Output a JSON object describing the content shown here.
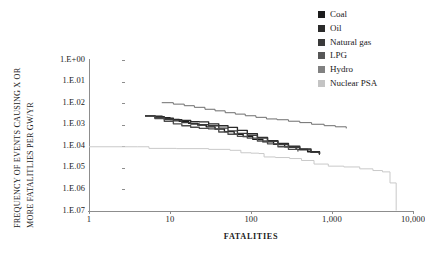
{
  "chart_data": {
    "type": "line",
    "title": "",
    "xlabel": "FATALITIES",
    "ylabel_line1": "FREQUENCY OF EVENTS CAUSING X OR",
    "ylabel_line2": "MORE FATALITLIES PER GW/YR",
    "x_scale": "log",
    "y_scale": "log",
    "xlim": [
      1,
      10000
    ],
    "ylim": [
      1e-07,
      1
    ],
    "x_ticks": [
      1,
      10,
      100,
      1000,
      10000
    ],
    "x_tick_labels": [
      "1",
      "10",
      "100",
      "1,000",
      "10,000"
    ],
    "y_ticks": [
      1,
      0.1,
      0.01,
      0.001,
      0.0001,
      1e-05,
      1e-06,
      1e-07
    ],
    "y_tick_labels": [
      "1.E+00",
      "1.E.01",
      "1.E.02",
      "1.E.03",
      "1.E.04",
      "1.E.05",
      "1.E.06",
      "1.E.07"
    ],
    "grid": false,
    "legend_position": "top-right",
    "series": [
      {
        "name": "Coal",
        "color": "#1c1c1c",
        "points": [
          [
            5.0,
            0.0026
          ],
          [
            6.2,
            0.0025
          ],
          [
            8.0,
            0.0021
          ],
          [
            10.0,
            0.00175
          ],
          [
            13.0,
            0.00145
          ],
          [
            17.0,
            0.00115
          ],
          [
            22.0,
            0.00095
          ],
          [
            28.0,
            0.0008
          ],
          [
            36.0,
            0.00062
          ],
          [
            47.0,
            0.00048
          ],
          [
            62.0,
            0.00036
          ],
          [
            80.0,
            0.00028
          ],
          [
            105.0,
            0.00021
          ],
          [
            140.0,
            0.00016
          ],
          [
            190.0,
            0.000125
          ],
          [
            260.0,
            9.5e-05
          ],
          [
            360.0,
            7.2e-05
          ],
          [
            500.0,
            5.6e-05
          ],
          [
            700.0,
            4.4e-05
          ]
        ]
      },
      {
        "name": "Oil",
        "color": "#2b2b2b",
        "points": [
          [
            5.0,
            0.0026
          ],
          [
            6.5,
            0.00235
          ],
          [
            8.5,
            0.002
          ],
          [
            11.0,
            0.0017
          ],
          [
            14.0,
            0.0016
          ],
          [
            18.0,
            0.0014
          ],
          [
            23.0,
            0.00135
          ],
          [
            30.0,
            0.0011
          ],
          [
            40.0,
            0.0009
          ],
          [
            52.0,
            0.00075
          ],
          [
            68.0,
            0.00055
          ],
          [
            90.0,
            0.00038
          ],
          [
            120.0,
            0.00026
          ],
          [
            160.0,
            0.00018
          ],
          [
            215.0,
            0.000135
          ],
          [
            290.0,
            0.0001
          ],
          [
            400.0,
            7.5e-05
          ],
          [
            550.0,
            5.6e-05
          ],
          [
            700.0,
            4.6e-05
          ]
        ]
      },
      {
        "name": "Natural gas",
        "color": "#3a3a3a",
        "points": [
          [
            5.0,
            0.00255
          ],
          [
            6.5,
            0.0022
          ],
          [
            8.5,
            0.0018
          ],
          [
            11.0,
            0.0015
          ],
          [
            14.0,
            0.00125
          ],
          [
            18.0,
            0.00108
          ],
          [
            23.0,
            0.001
          ],
          [
            30.0,
            0.0009
          ],
          [
            40.0,
            0.0007
          ],
          [
            52.0,
            0.00052
          ],
          [
            68.0,
            0.0004
          ],
          [
            90.0,
            0.00032
          ],
          [
            120.0,
            0.00024
          ],
          [
            160.0,
            0.00017
          ],
          [
            215.0,
            0.00012
          ],
          [
            290.0,
            9e-05
          ],
          [
            400.0,
            6.8e-05
          ],
          [
            550.0,
            5.2e-05
          ],
          [
            700.0,
            4.4e-05
          ]
        ]
      },
      {
        "name": "LPG",
        "color": "#4c4c4c",
        "points": [
          [
            5.0,
            0.0025
          ],
          [
            6.5,
            0.00195
          ],
          [
            8.5,
            0.00145
          ],
          [
            11.0,
            0.0011
          ],
          [
            14.0,
            0.0009
          ],
          [
            18.0,
            0.00076
          ],
          [
            23.0,
            0.00068
          ],
          [
            30.0,
            0.00064
          ],
          [
            40.0,
            0.00046
          ],
          [
            52.0,
            0.00036
          ],
          [
            68.0,
            0.00029
          ],
          [
            90.0,
            0.00024
          ],
          [
            120.0,
            0.000175
          ],
          [
            160.0,
            0.00013
          ],
          [
            215.0,
            9.5e-05
          ],
          [
            290.0,
            7.2e-05
          ],
          [
            380.0,
            6e-05
          ]
        ]
      },
      {
        "name": "Hydro",
        "color": "#6e6e6e",
        "points": [
          [
            8.0,
            0.0105
          ],
          [
            11.0,
            0.009
          ],
          [
            15.0,
            0.0076
          ],
          [
            20.0,
            0.0064
          ],
          [
            27.0,
            0.0052
          ],
          [
            36.0,
            0.0044
          ],
          [
            48.0,
            0.0036
          ],
          [
            64.0,
            0.0031
          ],
          [
            85.0,
            0.0026
          ],
          [
            115.0,
            0.0022
          ],
          [
            155.0,
            0.00185
          ],
          [
            210.0,
            0.0017
          ],
          [
            290.0,
            0.00145
          ],
          [
            400.0,
            0.00125
          ],
          [
            560.0,
            0.00105
          ],
          [
            800.0,
            0.0009
          ],
          [
            1100.0,
            0.0008
          ],
          [
            1500.0,
            0.0007
          ]
        ]
      },
      {
        "name": "Nuclear PSA",
        "color": "#c9c9c9",
        "points": [
          [
            1.0,
            9.5e-05
          ],
          [
            4.0,
            9.5e-05
          ],
          [
            5.5,
            8e-05
          ],
          [
            12.0,
            7.8e-05
          ],
          [
            30.0,
            7.2e-05
          ],
          [
            55.0,
            6.5e-05
          ],
          [
            75.0,
            5e-05
          ],
          [
            100.0,
            4.8e-05
          ],
          [
            125.0,
            4.6e-05
          ],
          [
            145.0,
            3.2e-05
          ],
          [
            200.0,
            3e-05
          ],
          [
            300.0,
            2.7e-05
          ],
          [
            420.0,
            2.2e-05
          ],
          [
            600.0,
            1.5e-05
          ],
          [
            900.0,
            1.2e-05
          ],
          [
            1400.0,
            1.1e-05
          ],
          [
            2200.0,
            9e-06
          ],
          [
            3200.0,
            7.5e-06
          ],
          [
            4200.0,
            6.5e-06
          ],
          [
            5200.0,
            2e-06
          ],
          [
            6200.0,
            1.1e-07
          ]
        ]
      }
    ]
  },
  "legend": {
    "items": [
      {
        "label": "Coal",
        "color": "#1c1c1c"
      },
      {
        "label": "Oil",
        "color": "#2b2b2b"
      },
      {
        "label": "Natural gas",
        "color": "#3a3a3a"
      },
      {
        "label": "LPG",
        "color": "#575757"
      },
      {
        "label": "Hydro",
        "color": "#818181"
      },
      {
        "label": "Nuclear PSA",
        "color": "#c4c4c4"
      }
    ]
  }
}
